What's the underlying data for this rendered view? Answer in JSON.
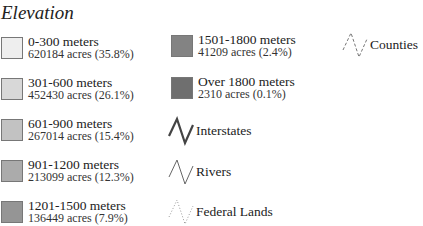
{
  "legend": {
    "title": "Elevation",
    "elevation_classes": [
      {
        "label": "0-300 meters",
        "detail": "620184 acres (35.8%)",
        "color": "#eeeeee"
      },
      {
        "label": "301-600 meters",
        "detail": "452430 acres (26.1%)",
        "color": "#d8d8d8"
      },
      {
        "label": "601-900 meters",
        "detail": "267014 acres (15.4%)",
        "color": "#c2c2c2"
      },
      {
        "label": "901-1200 meters",
        "detail": "213099 acres (12.3%)",
        "color": "#ababab"
      },
      {
        "label": "1201-1500 meters",
        "detail": "136449 acres (7.9%)",
        "color": "#959595"
      },
      {
        "label": "1501-1800 meters",
        "detail": "41209 acres (2.4%)",
        "color": "#838383"
      },
      {
        "label": "Over 1800 meters",
        "detail": "2310 acres (0.1%)",
        "color": "#6f6f6f"
      }
    ],
    "line_features": [
      {
        "label": "Interstates",
        "icon": "interstate-line-icon",
        "style": "solid-thick",
        "color": "#444444"
      },
      {
        "label": "Rivers",
        "icon": "river-line-icon",
        "style": "solid-thin",
        "color": "#666666"
      },
      {
        "label": "Federal Lands",
        "icon": "federal-lands-line-icon",
        "style": "dotted",
        "color": "#999999"
      },
      {
        "label": "Counties",
        "icon": "county-line-icon",
        "style": "dashed",
        "color": "#777777"
      }
    ]
  }
}
